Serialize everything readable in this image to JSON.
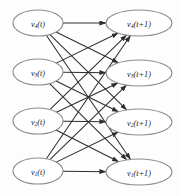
{
  "figure": {
    "background_color": "#fdfdfd",
    "node_stroke_color": "#8d8d8d",
    "node_fill_color": "#ffffff",
    "edge_color": "#2e2e2e",
    "label_color": "#1a1a1a",
    "width": 178,
    "height": 196
  },
  "chart_data": {
    "type": "diagram",
    "subtype": "complete-bipartite-directed-graph",
    "title": "",
    "left_column_label": "v(t)",
    "right_column_label": "v(t+1)",
    "edge_count": 16,
    "fully_connected": true,
    "nodes": {
      "left": [
        {
          "id": "v4_t",
          "base": "v",
          "subscript": "4",
          "argument": "(t)",
          "text": "v4(t)",
          "cx": 38,
          "cy": 23,
          "rx": 25,
          "ry": 13
        },
        {
          "id": "v3_t",
          "base": "v",
          "subscript": "3",
          "argument": "(t)",
          "text": "v3(t)",
          "cx": 38,
          "cy": 72,
          "rx": 25,
          "ry": 13
        },
        {
          "id": "v2_t",
          "base": "v",
          "subscript": "2",
          "argument": "(t)",
          "text": "v2(t)",
          "cx": 38,
          "cy": 121,
          "rx": 25,
          "ry": 13
        },
        {
          "id": "v1_t",
          "base": "v",
          "subscript": "1",
          "argument": "(t)",
          "text": "v1(t)",
          "cx": 38,
          "cy": 171,
          "rx": 25,
          "ry": 13
        }
      ],
      "right": [
        {
          "id": "v4_t1",
          "base": "v",
          "subscript": "4",
          "argument": "(t+1)",
          "text": "v4(t+1)",
          "cx": 139,
          "cy": 23,
          "rx": 33,
          "ry": 13
        },
        {
          "id": "v3_t1",
          "base": "v",
          "subscript": "3",
          "argument": "(t+1)",
          "text": "v3(t+1)",
          "cx": 139,
          "cy": 73,
          "rx": 33,
          "ry": 13
        },
        {
          "id": "v2_t1",
          "base": "v",
          "subscript": "2",
          "argument": "(t+1)",
          "text": "v2(t+1)",
          "cx": 139,
          "cy": 122,
          "rx": 33,
          "ry": 13
        },
        {
          "id": "v1_t1",
          "base": "v",
          "subscript": "1",
          "argument": "(t+1)",
          "text": "v1(t+1)",
          "cx": 139,
          "cy": 172,
          "rx": 33,
          "ry": 13
        }
      ]
    },
    "edges": [
      {
        "from": "v4_t",
        "to": "v4_t1"
      },
      {
        "from": "v4_t",
        "to": "v3_t1"
      },
      {
        "from": "v4_t",
        "to": "v2_t1"
      },
      {
        "from": "v4_t",
        "to": "v1_t1"
      },
      {
        "from": "v3_t",
        "to": "v4_t1"
      },
      {
        "from": "v3_t",
        "to": "v3_t1"
      },
      {
        "from": "v3_t",
        "to": "v2_t1"
      },
      {
        "from": "v3_t",
        "to": "v1_t1"
      },
      {
        "from": "v2_t",
        "to": "v4_t1"
      },
      {
        "from": "v2_t",
        "to": "v3_t1"
      },
      {
        "from": "v2_t",
        "to": "v2_t1"
      },
      {
        "from": "v2_t",
        "to": "v1_t1"
      },
      {
        "from": "v1_t",
        "to": "v4_t1"
      },
      {
        "from": "v1_t",
        "to": "v3_t1"
      },
      {
        "from": "v1_t",
        "to": "v2_t1"
      },
      {
        "from": "v1_t",
        "to": "v1_t1"
      }
    ]
  }
}
